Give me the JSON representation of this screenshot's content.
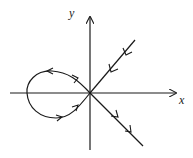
{
  "diagram": {
    "type": "phase-portrait",
    "axes": {
      "x_label": "x",
      "y_label": "y"
    },
    "elements": [
      {
        "name": "x-axis",
        "direction": "right"
      },
      {
        "name": "y-axis",
        "direction": "up"
      },
      {
        "name": "stable-manifold",
        "from": "upper-right",
        "flow": "toward origin"
      },
      {
        "name": "unstable-manifold",
        "to": "lower-right",
        "flow": "away from origin"
      },
      {
        "name": "homoclinic-loop",
        "side": "left",
        "flow": "counterclockwise from origin (out upper-left, back lower)"
      }
    ],
    "stroke_color": "#1a1a1a"
  }
}
